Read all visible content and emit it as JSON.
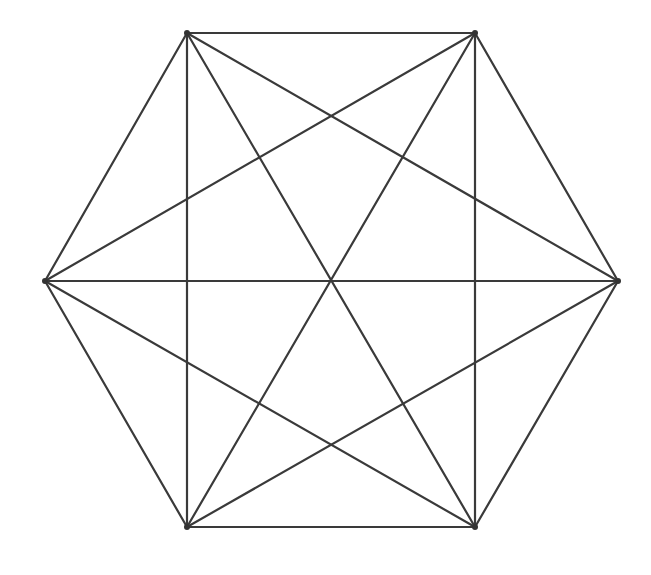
{
  "diagram": {
    "type": "complete-graph",
    "name": "K6 on regular hexagon",
    "colors": {
      "background": "#ffffff",
      "line": "#3a3a3a",
      "vertex": "#333333"
    },
    "vertices": [
      {
        "id": "TL",
        "x": 187,
        "y": 33
      },
      {
        "id": "TR",
        "x": 475,
        "y": 33
      },
      {
        "id": "R",
        "x": 618,
        "y": 281
      },
      {
        "id": "BR",
        "x": 475,
        "y": 527
      },
      {
        "id": "BL",
        "x": 187,
        "y": 527
      },
      {
        "id": "L",
        "x": 45,
        "y": 281
      }
    ],
    "edges": [
      [
        "TL",
        "TR"
      ],
      [
        "TR",
        "R"
      ],
      [
        "R",
        "BR"
      ],
      [
        "BR",
        "BL"
      ],
      [
        "BL",
        "L"
      ],
      [
        "L",
        "TL"
      ],
      [
        "TL",
        "R"
      ],
      [
        "TL",
        "BR"
      ],
      [
        "TL",
        "BL"
      ],
      [
        "TR",
        "BR"
      ],
      [
        "TR",
        "BL"
      ],
      [
        "TR",
        "L"
      ],
      [
        "R",
        "BL"
      ],
      [
        "R",
        "L"
      ],
      [
        "BR",
        "L"
      ]
    ]
  }
}
